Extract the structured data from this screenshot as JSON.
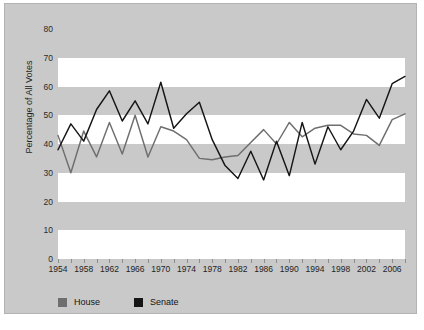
{
  "chart_data": {
    "type": "line",
    "title": "",
    "xlabel": "",
    "ylabel": "Percentage of All Votes",
    "ylim": [
      0,
      80
    ],
    "xlim": [
      1954,
      2008
    ],
    "yticks": [
      0,
      10,
      20,
      30,
      40,
      50,
      60,
      70,
      80
    ],
    "xticks": [
      1954,
      1956,
      1958,
      1960,
      1962,
      1964,
      1966,
      1968,
      1970,
      1972,
      1974,
      1976,
      1978,
      1980,
      1982,
      1984,
      1986,
      1988,
      1990,
      1992,
      1994,
      1996,
      1998,
      2000,
      2002,
      2004,
      2006,
      2008
    ],
    "xtick_labels": [
      "1954",
      "1958",
      "1962",
      "1966",
      "1970",
      "1974",
      "1978",
      "1982",
      "1986",
      "1990",
      "1994",
      "1998",
      "2002",
      "2006"
    ],
    "xtick_label_values": [
      1954,
      1958,
      1962,
      1966,
      1970,
      1974,
      1978,
      1982,
      1986,
      1990,
      1994,
      1998,
      2002,
      2006
    ],
    "grid": "horizontal-bands",
    "legend_position": "bottom-left",
    "x": [
      1954,
      1956,
      1958,
      1960,
      1962,
      1964,
      1966,
      1968,
      1970,
      1972,
      1974,
      1976,
      1978,
      1980,
      1982,
      1984,
      1986,
      1988,
      1990,
      1992,
      1994,
      1996,
      1998,
      2000,
      2002,
      2004,
      2006,
      2008
    ],
    "series": [
      {
        "name": "House",
        "color": "#6e6e6e",
        "values": [
          43.0,
          30.0,
          44.5,
          35.5,
          47.5,
          36.5,
          50.0,
          35.5,
          46.0,
          44.5,
          41.5,
          35.0,
          34.5,
          35.5,
          36.0,
          40.5,
          45.0,
          40.0,
          47.5,
          42.5,
          45.5,
          46.5,
          46.5,
          43.5,
          43.0,
          39.5,
          48.5,
          50.5
        ]
      },
      {
        "name": "Senate",
        "color": "#151515",
        "values": [
          38.0,
          47.0,
          41.0,
          52.0,
          58.5,
          48.0,
          55.0,
          47.0,
          61.5,
          45.5,
          50.5,
          54.5,
          41.5,
          32.5,
          28.0,
          37.5,
          27.5,
          41.0,
          29.0,
          47.5,
          33.0,
          46.0,
          38.0,
          44.5,
          55.5,
          49.0,
          61.0,
          63.5
        ]
      }
    ],
    "series_house_full": {
      "name": "House",
      "points": [
        [
          1954,
          43.0
        ],
        [
          1955,
          38.5
        ],
        [
          1956,
          30.0
        ],
        [
          1957,
          44.5
        ],
        [
          1958,
          45.5
        ],
        [
          1959,
          35.5
        ],
        [
          1960,
          47.5
        ],
        [
          1961,
          47.0
        ],
        [
          1962,
          36.5
        ],
        [
          1963,
          50.0
        ],
        [
          1964,
          44.5
        ],
        [
          1965,
          35.5
        ],
        [
          1966,
          46.0
        ],
        [
          1967,
          44.5
        ],
        [
          1968,
          41.5
        ],
        [
          1969,
          35.0
        ],
        [
          1970,
          34.5
        ],
        [
          1971,
          35.5
        ],
        [
          1972,
          36.0
        ],
        [
          1973,
          40.5
        ],
        [
          1974,
          45.0
        ],
        [
          1975,
          40.0
        ],
        [
          1976,
          47.5
        ],
        [
          1977,
          42.5
        ],
        [
          1978,
          45.5
        ],
        [
          1979,
          46.5
        ],
        [
          1980,
          46.5
        ],
        [
          1981,
          43.5
        ],
        [
          1982,
          43.0
        ],
        [
          1983,
          39.5
        ],
        [
          1984,
          48.5
        ],
        [
          1985,
          50.5
        ]
      ]
    },
    "annotations": []
  },
  "legend": {
    "items": [
      {
        "label": "House",
        "color": "#6e6e6e"
      },
      {
        "label": "Senate",
        "color": "#151515"
      }
    ]
  },
  "axes": {
    "y_title": "Percentage of All Votes",
    "y_tick_labels": [
      "80",
      "70",
      "60",
      "50",
      "40",
      "30",
      "20",
      "10",
      "0"
    ],
    "x_tick_labels": [
      "1954",
      "1958",
      "1962",
      "1966",
      "1970",
      "1974",
      "1978",
      "1982",
      "1986",
      "1990",
      "1994",
      "1998",
      "2002",
      "2006"
    ]
  },
  "colors": {
    "panel_background": "#c9c9c9",
    "band_light": "#ffffff",
    "band_dark": "#c9c9c9",
    "house": "#6e6e6e",
    "senate": "#151515",
    "text": "#1f1f1f"
  }
}
